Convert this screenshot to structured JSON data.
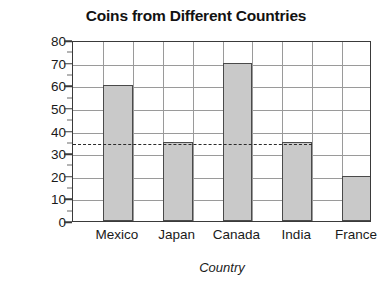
{
  "chart_data": {
    "type": "bar",
    "title": "Coins from Different Countries",
    "xlabel": "Country",
    "ylabel": "Number of Coins",
    "categories": [
      "Mexico",
      "Japan",
      "Canada",
      "India",
      "France"
    ],
    "values": [
      60,
      35,
      70,
      35,
      20
    ],
    "ylim": [
      0,
      80
    ],
    "ytick_step": 10,
    "yticks": [
      0,
      10,
      20,
      30,
      40,
      50,
      60,
      70,
      80
    ],
    "ytick_labels": [
      "0",
      "10",
      "20",
      "30",
      "40",
      "50",
      "60",
      "70",
      "80"
    ],
    "minor_tick_step": 5,
    "grid": true,
    "legend": null,
    "annotations": [
      {
        "type": "reference-line",
        "orientation": "horizontal",
        "value": 35,
        "style": "dashed",
        "label": ""
      }
    ],
    "bar_fill": "#c9c9c9",
    "bar_edge": "#4a4a4a",
    "grid_color": "#9a9a9a",
    "axis_color": "#3a3a3a",
    "text_color": "#1a1a1a",
    "background": "#ffffff"
  }
}
